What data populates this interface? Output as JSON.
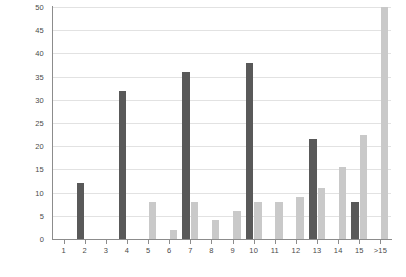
{
  "chart_data": {
    "type": "bar",
    "title": "",
    "subtitle": "",
    "xlabel": "",
    "ylabel": "",
    "categories": [
      "1",
      "2",
      "3",
      "4",
      "5",
      "6",
      "7",
      "8",
      "9",
      "10",
      "11",
      "12",
      "13",
      "14",
      "15",
      ">15"
    ],
    "series": [
      {
        "name": "Series 1",
        "color": "#595959",
        "values": [
          0,
          12,
          0,
          32,
          0,
          0,
          36,
          0,
          0,
          38,
          0,
          0,
          21.5,
          0,
          8,
          0
        ]
      },
      {
        "name": "Series 2",
        "color": "#c9c9c9",
        "values": [
          0,
          0,
          0,
          0,
          8,
          2,
          8,
          4,
          6,
          8,
          8,
          9,
          11,
          15.5,
          22.5,
          50
        ]
      }
    ],
    "ylim": [
      0,
      50
    ],
    "yticks": [
      0,
      5,
      10,
      15,
      20,
      25,
      30,
      35,
      40,
      45,
      50
    ],
    "ytick_labels": [
      "0",
      "5",
      "10",
      "15",
      "20",
      "25",
      "30",
      "35",
      "40",
      "45",
      "50"
    ],
    "grid": true,
    "grid_axis": "y",
    "legend": false,
    "legend_position": "none",
    "background": "#ffffff",
    "grid_color": "#e2e2e2",
    "axis_color": "#8c8c8c",
    "tick_label_color": "#4a4a4a"
  }
}
